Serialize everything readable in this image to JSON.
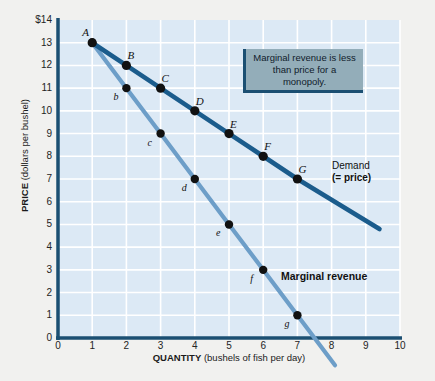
{
  "chart_data": {
    "type": "line",
    "title": "",
    "xlabel_bold": "QUANTITY",
    "xlabel_rest": " (bushels of fish per day)",
    "ylabel_bold": "PRICE",
    "ylabel_rest": " (dollars per bushel)",
    "xlim": [
      0,
      10
    ],
    "ylim": [
      0,
      14
    ],
    "grid": true,
    "xticks": [
      "0",
      "1",
      "2",
      "3",
      "4",
      "5",
      "6",
      "7",
      "8",
      "9",
      "10"
    ],
    "yticks": [
      "$14",
      "13",
      "12",
      "11",
      "10",
      "9",
      "8",
      "7",
      "6",
      "5",
      "4",
      "3",
      "2",
      "1",
      "0"
    ],
    "legend_position": "inline-right",
    "series": [
      {
        "name": "Demand (= price)",
        "label_line1": "Demand",
        "label_line2": "(= price)",
        "color": "#1b5c8c",
        "x": [
          1,
          2,
          3,
          4,
          5,
          6,
          7
        ],
        "values": [
          13,
          12,
          11,
          10,
          9,
          8,
          7
        ],
        "point_labels": [
          "A",
          "B",
          "C",
          "D",
          "E",
          "F",
          "G"
        ],
        "extends_to": [
          9.4,
          4.8
        ]
      },
      {
        "name": "Marginal revenue",
        "label_line1": "Marginal revenue",
        "label_line2": "",
        "color": "#6d9ec8",
        "x": [
          1,
          2,
          3,
          4,
          5,
          6,
          7
        ],
        "values": [
          13,
          11,
          9,
          7,
          5,
          3,
          1
        ],
        "point_labels": [
          "A",
          "b",
          "c",
          "d",
          "e",
          "f",
          "g"
        ],
        "extends_to": [
          8.1,
          -1.2
        ],
        "x_intercept": 7.5
      }
    ],
    "annotations": [
      {
        "id": "callout",
        "text": "Marginal revenue is less than price for a monopoly."
      }
    ],
    "colors": {
      "plot_background": "#dce9f5",
      "page_background": "#f1f1ef",
      "gridline": "#ffffff",
      "axis": "#1b4f72",
      "demand": "#1b5c8c",
      "marginal_revenue": "#6d9ec8",
      "callout_fill": "#93adb9",
      "callout_border": "#1b4f72",
      "point_fill": "#111111"
    }
  }
}
